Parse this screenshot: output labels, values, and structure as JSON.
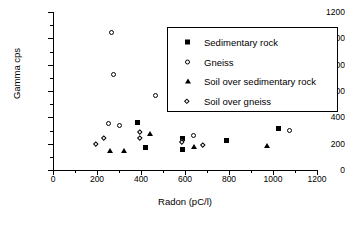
{
  "chart_data": {
    "type": "scatter",
    "title": "",
    "xlabel": "Radon (pC/l)",
    "ylabel": "Gamma cps",
    "xlim": [
      0,
      1200
    ],
    "ylim": [
      0,
      1200
    ],
    "xticks": [
      0,
      200,
      400,
      600,
      800,
      1000,
      1200
    ],
    "yticks": [
      0,
      200,
      400,
      600,
      800,
      1000,
      1200
    ],
    "grid": false,
    "legend_position": "upper right",
    "series": [
      {
        "name": "Sedimentary rock",
        "marker": "filled-square",
        "points": [
          [
            386,
            360
          ],
          [
            419,
            172
          ],
          [
            589,
            240
          ],
          [
            589,
            157
          ],
          [
            790,
            222
          ],
          [
            1027,
            315
          ]
        ]
      },
      {
        "name": "Gneiss",
        "marker": "open-circle",
        "points": [
          [
            268,
            1042
          ],
          [
            273,
            726
          ],
          [
            464,
            568
          ],
          [
            250,
            352
          ],
          [
            300,
            335
          ],
          [
            640,
            262
          ],
          [
            1077,
            300
          ]
        ]
      },
      {
        "name": "Soil over sedimentary rock",
        "marker": "filled-triangle",
        "points": [
          [
            259,
            145
          ],
          [
            322,
            145
          ],
          [
            441,
            275
          ],
          [
            640,
            180
          ],
          [
            972,
            182
          ]
        ]
      },
      {
        "name": "Soil over gneiss",
        "marker": "open-diamond",
        "points": [
          [
            196,
            196
          ],
          [
            236,
            240
          ],
          [
            400,
            285
          ],
          [
            400,
            237
          ],
          [
            589,
            205
          ],
          [
            684,
            186
          ]
        ]
      }
    ]
  },
  "legend": {
    "entries": [
      {
        "label": "Sedimentary rock",
        "marker": "filled-square"
      },
      {
        "label": "Gneiss",
        "marker": "open-circle"
      },
      {
        "label": "Soil over sedimentary rock",
        "marker": "filled-triangle"
      },
      {
        "label": "Soil over gneiss",
        "marker": "open-diamond"
      }
    ]
  }
}
